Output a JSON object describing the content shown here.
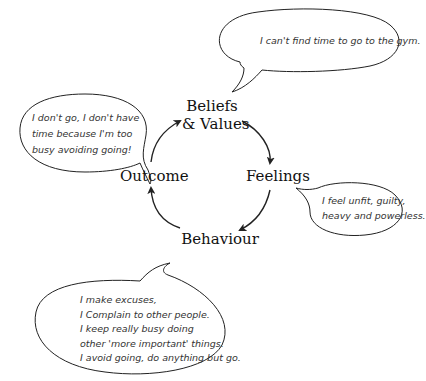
{
  "diagram": {
    "type": "cycle",
    "nodes": [
      {
        "id": "beliefs",
        "label_line1": "Beliefs",
        "label_line2": "& Values"
      },
      {
        "id": "feelings",
        "label": "Feelings"
      },
      {
        "id": "behaviour",
        "label": "Behaviour"
      },
      {
        "id": "outcome",
        "label": "Outcome"
      }
    ],
    "edges": [
      {
        "from": "beliefs",
        "to": "feelings"
      },
      {
        "from": "feelings",
        "to": "behaviour"
      },
      {
        "from": "behaviour",
        "to": "outcome"
      },
      {
        "from": "outcome",
        "to": "beliefs"
      }
    ],
    "bubbles": {
      "beliefs": {
        "lines": [
          "I can't find time to go to the gym."
        ]
      },
      "feelings": {
        "lines": [
          "I feel unfit, guilty,",
          "heavy and powerless."
        ]
      },
      "behaviour": {
        "lines": [
          "I make excuses,",
          "I Complain to other people.",
          "I keep really busy doing",
          "other 'more important' things.",
          "I avoid going, do anything but go."
        ]
      },
      "outcome": {
        "lines": [
          "I don't go, I don't have",
          "time because I'm too",
          "busy avoiding going!"
        ]
      }
    },
    "colors": {
      "stroke": "#222222",
      "text": "#111111",
      "bubble_text": "#333333",
      "background": "#ffffff"
    }
  }
}
